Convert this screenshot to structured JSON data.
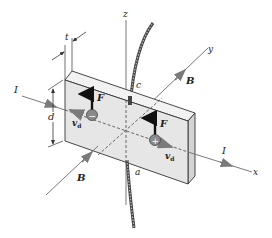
{
  "figure": {
    "axes": {
      "x": "x",
      "y": "y",
      "z": "z"
    },
    "labels": {
      "current_left": "I",
      "current_right": "I",
      "field_upper": "B",
      "field_lower": "B",
      "force_negative": "F",
      "force_positive": "F",
      "drift_left": "v",
      "drift_left_sub": "d",
      "drift_right": "v",
      "drift_right_sub": "d",
      "thickness": "t",
      "width": "d",
      "point_c": "c",
      "point_a": "a"
    },
    "charges": {
      "negative": "−",
      "positive": "+"
    },
    "colors": {
      "slab_front": "#e6e6e6",
      "slab_top": "#f2f2f2",
      "slab_side": "#d4d4d4",
      "edge": "#333333",
      "charge_fill": "#8a8a8a",
      "arrow_gray": "#7a7a7a",
      "force_arrow": "#111111"
    }
  }
}
